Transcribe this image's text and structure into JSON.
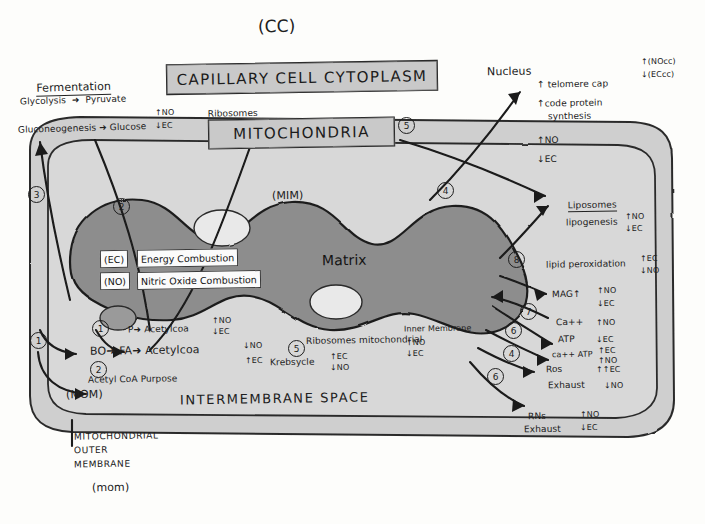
{
  "meta": {
    "top_tag": "(CC)"
  },
  "banners": {
    "capillary": "CAPILLARY CELL CYTOPLASM",
    "ribosomes_note": "Ribosomes",
    "ribosomes_note_rest": "for Protein Synthesis",
    "mitochondria": "MITOCHONDRIA"
  },
  "left_panel": {
    "heading": "Fermentation",
    "lines": [
      "Glycolysis  ➜  Pyruvate",
      "Gluconeogenesis ➜ Glucose"
    ],
    "deltas": [
      "↑NO",
      "↓EC"
    ]
  },
  "membrane_labels": {
    "mim": "(MIM)",
    "mom_inner": "(MOM)",
    "mom_small": "(mom)",
    "intermembrane": "INTERMEMBRANE SPACE",
    "matrix": "Matrix",
    "outer_caption": [
      "MITOCHONDRIAL",
      "OUTER",
      "MEMBRANE"
    ]
  },
  "matrix_boxes": [
    {
      "tag": "(EC)",
      "text": "Energy Combustion"
    },
    {
      "tag": "(NO)",
      "text": "Nitric Oxide Combustion"
    }
  ],
  "pathways": [
    {
      "id": "p1",
      "text": "P➜ Acetylcoa",
      "deltas": [
        "↑NO",
        "↓EC"
      ]
    },
    {
      "id": "p2",
      "text": "BO➜ FA➜ Acetylcoa",
      "deltas": [
        "↓NO",
        "↑EC"
      ]
    },
    {
      "id": "p3",
      "text": "Acetyl CoA Purpose",
      "deltas": []
    }
  ],
  "center_notes": {
    "krebs": "Krebsycle",
    "krebs_deltas": [
      "↑EC",
      "↓NO"
    ],
    "ribosomes_mito": "Ribosomes mitochondrial",
    "inner_membrane": "Inner Membrane",
    "inner_membrane_deltas": [
      "↑NO",
      "↓EC"
    ]
  },
  "nucleus": {
    "heading": "Nucleus",
    "corner_deltas": [
      "↑(NOcc)",
      "↓(ECcc)"
    ],
    "items": [
      "↑ telomere cap",
      "↑code protein",
      "synthesis",
      "↑NO",
      "↓EC"
    ]
  },
  "liposomes": {
    "heading": "Liposomes",
    "rows": [
      {
        "label": "lipogenesis",
        "deltas": [
          "↑NO",
          "↓EC"
        ]
      },
      {
        "label": "lipid peroxidation",
        "deltas": [
          "↑EC",
          "↓NO"
        ]
      },
      {
        "label": "MAG↑",
        "deltas": [
          "↑NO",
          "↓EC"
        ]
      }
    ]
  },
  "energetics": {
    "rows": [
      {
        "label": "Ca++",
        "deltas": [
          "↑NO"
        ]
      },
      {
        "label": "ATP",
        "deltas": [
          "↓EC"
        ]
      },
      {
        "label": "ca++ ATP",
        "deltas": [
          "↑EC",
          "↑NO"
        ]
      },
      {
        "label": "Ros",
        "deltas": [
          "↑↑EC"
        ]
      },
      {
        "label": "Exhaust",
        "deltas": [
          "↓NO"
        ]
      }
    ]
  },
  "rns": {
    "label_line1": "RNs",
    "label_line2": "Exhaust",
    "deltas": [
      "↑NO",
      "↓EC"
    ]
  },
  "callout_numbers": [
    "3",
    "2",
    "1",
    "1",
    "2",
    "5",
    "4",
    "8",
    "7",
    "6",
    "4",
    "6"
  ],
  "colors": {
    "ink": "#1d1d1d",
    "banner_fill": "#c9c9c9",
    "cytoplasm_fill": "#cfcfcf",
    "intermembrane_fill": "#d8d8d8",
    "matrix_fill": "#8d8d8d",
    "paper": "#fdfdfb"
  }
}
